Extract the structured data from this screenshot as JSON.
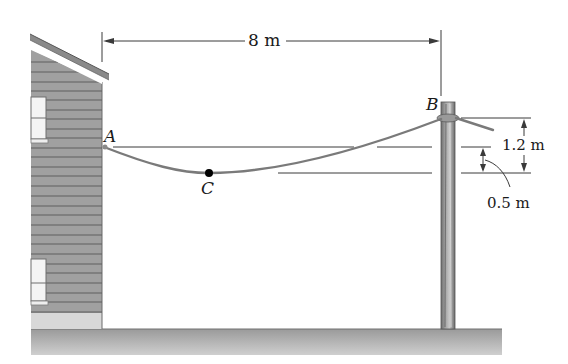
{
  "figure": {
    "points": {
      "A": "A",
      "B": "B",
      "C": "C"
    },
    "dimensions": {
      "span": "8 m",
      "height_difference": "1.2 m",
      "sag_offset": "0.5 m"
    },
    "colors": {
      "cable": "#7a7a7a",
      "house_siding": "#9c9c9c",
      "siding_lines": "#5e5e5e",
      "pole": "#8a8a8a",
      "ground": "#b4b4b4",
      "dimension_lines": "#3a3a3a",
      "point_marker": "#000000"
    }
  }
}
